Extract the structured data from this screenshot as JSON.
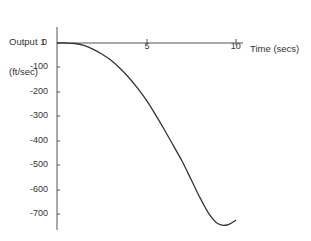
{
  "chart_data": {
    "type": "line",
    "title": "",
    "xlabel": "Time (secs)",
    "ylabel": "Output 1\n(ft/sec)",
    "xlim": [
      0,
      10
    ],
    "ylim": [
      -750,
      0
    ],
    "x_ticks": [
      "5",
      "10"
    ],
    "y_ticks": [
      "0",
      "-100",
      "-200",
      "-300",
      "-400",
      "-500",
      "-600",
      "-700"
    ],
    "grid": false,
    "legend": null,
    "series": [
      {
        "name": "Output 1",
        "x": [
          0,
          0.5,
          1,
          1.5,
          2,
          2.5,
          3,
          3.5,
          4,
          4.5,
          5,
          5.5,
          6,
          6.5,
          7,
          7.5,
          8,
          8.5,
          9,
          9.5,
          10
        ],
        "values": [
          0,
          0,
          -2,
          -10,
          -25,
          -45,
          -70,
          -102,
          -140,
          -185,
          -235,
          -293,
          -355,
          -420,
          -485,
          -560,
          -635,
          -700,
          -740,
          -745,
          -725
        ]
      }
    ]
  },
  "axes": {
    "y_label_line1": "Output 1",
    "y_label_line2": "(ft/sec)",
    "x_label": "Time (secs)",
    "y_ticks": [
      {
        "label": "0",
        "y": 43
      },
      {
        "label": "-100",
        "y": 67
      },
      {
        "label": "-200",
        "y": 92
      },
      {
        "label": "-300",
        "y": 116
      },
      {
        "label": "-400",
        "y": 141
      },
      {
        "label": "-500",
        "y": 165
      },
      {
        "label": "-600",
        "y": 190
      },
      {
        "label": "-700",
        "y": 214
      }
    ],
    "x_ticks": [
      {
        "label": "5",
        "x": 147
      },
      {
        "label": "10",
        "x": 236
      }
    ]
  },
  "colors": {
    "axis": "#555555",
    "line": "#333333",
    "text": "#333333",
    "background": "#ffffff"
  }
}
